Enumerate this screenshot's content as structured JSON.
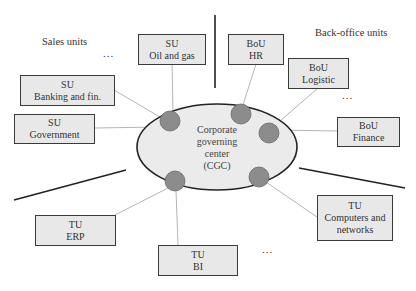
{
  "diagram": {
    "center": {
      "lines": [
        "Corporate",
        "governing",
        "center",
        "(CGC)"
      ],
      "fill": "#ebebeb",
      "stroke": "#222222"
    },
    "group_labels": {
      "sales": "Sales units",
      "backoffice": "Back-office units"
    },
    "ellipsis": "...",
    "node_color": "#8c8c8c",
    "sales_units": [
      {
        "type": "SU",
        "name": "Oil and gas"
      },
      {
        "type": "SU",
        "name": "Banking and fin."
      },
      {
        "type": "SU",
        "name": "Government"
      }
    ],
    "backoffice_units": [
      {
        "type": "BoU",
        "name": "HR"
      },
      {
        "type": "BoU",
        "name": "Logistic"
      },
      {
        "type": "BoU",
        "name": "Finance"
      }
    ],
    "technical_units": [
      {
        "type": "TU",
        "name": "ERP"
      },
      {
        "type": "TU",
        "name": "BI"
      },
      {
        "type": "TU",
        "name": "Computers and",
        "name2": "networks"
      }
    ]
  }
}
